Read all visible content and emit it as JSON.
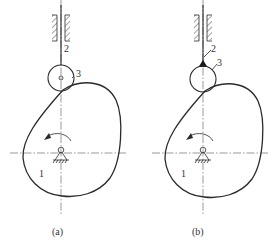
{
  "figure": {
    "subfigures": [
      {
        "id": "a",
        "caption": "(a)",
        "follower_type": "roller",
        "labels": {
          "cam": "1",
          "follower_rod": "2",
          "roller": "3"
        }
      },
      {
        "id": "b",
        "caption": "(b)",
        "follower_type": "roller-welded",
        "labels": {
          "cam": "1",
          "follower_rod": "2",
          "roller": "3"
        }
      }
    ],
    "colors": {
      "line": "#2a2a2a",
      "background": "#ffffff"
    }
  }
}
